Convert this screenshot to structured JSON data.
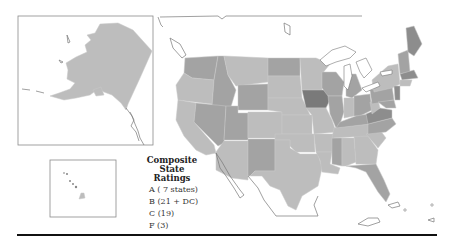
{
  "map": {
    "title": "Composite State Ratings",
    "colors": {
      "A": "#8d8d8d",
      "B": "#bdbdbd",
      "C": "#a3a3a3",
      "F": "#7a7a7a"
    },
    "insets": [
      "Alaska",
      "Hawaii"
    ]
  },
  "legend": {
    "title_line1": "Composite State",
    "title_line2": "Ratings",
    "items": [
      {
        "grade": "A",
        "label": "A ( 7 states)",
        "color": "#8d8d8d"
      },
      {
        "grade": "B",
        "label": "B (21 + DC)",
        "color": "#bdbdbd"
      },
      {
        "grade": "C",
        "label": "C (19)",
        "color": "#a3a3a3"
      },
      {
        "grade": "F",
        "label": "F (3)",
        "color": "#7a7a7a"
      }
    ]
  }
}
